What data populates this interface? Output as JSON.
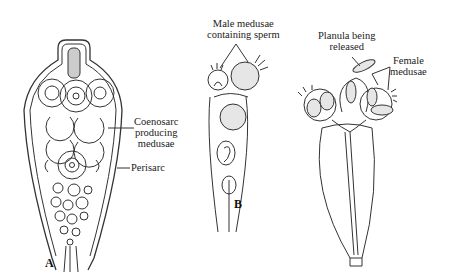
{
  "figure": {
    "panels": [
      {
        "id": "A",
        "label": "A",
        "annotations": [
          {
            "line1": "Coenosarc",
            "line2": "producing",
            "line3": "medusae"
          },
          {
            "line1": "Perisarc"
          }
        ]
      },
      {
        "id": "B",
        "label": "B",
        "annotations": [
          {
            "line1": "Male medusae",
            "line2": "containing sperm"
          },
          {
            "line1": "Planula being",
            "line2": "released"
          },
          {
            "line1": "Female",
            "line2": "medusae"
          }
        ]
      }
    ]
  }
}
